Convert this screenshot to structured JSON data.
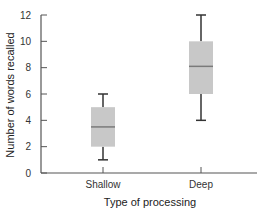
{
  "chart_data": {
    "type": "box",
    "title": "",
    "xlabel": "Type of processing",
    "ylabel": "Number of words recalled",
    "ylim": [
      0,
      12
    ],
    "yticks": [
      0,
      2,
      4,
      6,
      8,
      10,
      12
    ],
    "grid": false,
    "legend": null,
    "categories": [
      "Shallow",
      "Deep"
    ],
    "series": [
      {
        "name": "Shallow",
        "min": 1,
        "q1": 2,
        "median": 3.5,
        "q3": 5,
        "max": 6
      },
      {
        "name": "Deep",
        "min": 4,
        "q1": 6,
        "median": 8.1,
        "q3": 10,
        "max": 12
      }
    ],
    "colors": {
      "box_fill": "#c8c8c8",
      "median_line": "#7a7a7a",
      "whisker": "#333333",
      "axis": "#555555"
    }
  }
}
